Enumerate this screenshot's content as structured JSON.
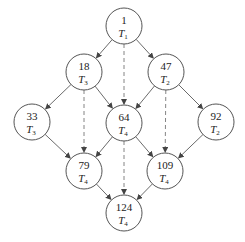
{
  "diagram": {
    "nodes": [
      {
        "id": "n1",
        "value": "1",
        "label": "T",
        "sub": "1",
        "x": 124,
        "y": 26
      },
      {
        "id": "n18",
        "value": "18",
        "label": "T",
        "sub": "3",
        "x": 84,
        "y": 72
      },
      {
        "id": "n47",
        "value": "47",
        "label": "T",
        "sub": "2",
        "x": 166,
        "y": 72
      },
      {
        "id": "n33",
        "value": "33",
        "label": "T",
        "sub": "3",
        "x": 32,
        "y": 122
      },
      {
        "id": "n64",
        "value": "64",
        "label": "T",
        "sub": "4",
        "x": 124,
        "y": 123
      },
      {
        "id": "n92",
        "value": "92",
        "label": "T",
        "sub": "2",
        "x": 216,
        "y": 122
      },
      {
        "id": "n79",
        "value": "79",
        "label": "T",
        "sub": "4",
        "x": 84,
        "y": 171
      },
      {
        "id": "n109",
        "value": "109",
        "label": "T",
        "sub": "4",
        "x": 165,
        "y": 171
      },
      {
        "id": "n124",
        "value": "124",
        "label": "T",
        "sub": "4",
        "x": 124,
        "y": 213
      }
    ],
    "solid_edges": [
      [
        "n1",
        "n18"
      ],
      [
        "n1",
        "n47"
      ],
      [
        "n18",
        "n33"
      ],
      [
        "n18",
        "n64"
      ],
      [
        "n47",
        "n64"
      ],
      [
        "n47",
        "n92"
      ],
      [
        "n33",
        "n79"
      ],
      [
        "n64",
        "n79"
      ],
      [
        "n64",
        "n109"
      ],
      [
        "n92",
        "n109"
      ],
      [
        "n79",
        "n124"
      ],
      [
        "n109",
        "n124"
      ]
    ],
    "dashed_edges": [
      [
        "n1",
        "n64"
      ],
      [
        "n18",
        "n79"
      ],
      [
        "n47",
        "n109"
      ],
      [
        "n64",
        "n124"
      ]
    ]
  }
}
